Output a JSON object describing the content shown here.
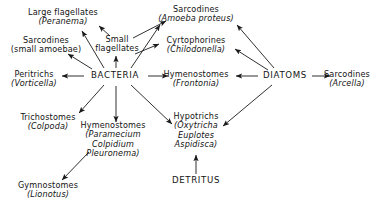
{
  "diagram": {
    "type": "food-web-diagram",
    "title": "",
    "background_color": "#ffffff",
    "text_color": "#131313",
    "nodes": [
      {
        "id": "large-flagellates",
        "lines": [
          "Large flagellates",
          "(Peranema)"
        ],
        "italic": [
          false,
          true
        ],
        "x": 63,
        "y": 17
      },
      {
        "id": "sarcodines-amoeba-proteus",
        "lines": [
          "Sarcodines",
          "(Amoeba proteus)"
        ],
        "italic": [
          false,
          true
        ],
        "x": 196,
        "y": 14
      },
      {
        "id": "small-flagellates",
        "lines": [
          "Small",
          "flagellates"
        ],
        "italic": [
          false,
          false
        ],
        "x": 117,
        "y": 44
      },
      {
        "id": "sarcodines-small-amoebae",
        "lines": [
          "Sarcodines",
          "(small amoebae)"
        ],
        "italic": [
          false,
          false
        ],
        "x": 46,
        "y": 45
      },
      {
        "id": "cyrtophorines",
        "lines": [
          "Cyrtophorines",
          "(Chilodonella)"
        ],
        "italic": [
          false,
          true
        ],
        "x": 196,
        "y": 45
      },
      {
        "id": "peritrichs",
        "lines": [
          "Peritrichs",
          "(Vorticella)"
        ],
        "italic": [
          false,
          true
        ],
        "x": 34,
        "y": 79
      },
      {
        "id": "bacteria",
        "lines": [
          "BACTERIA"
        ],
        "italic": [
          false
        ],
        "x": 115,
        "y": 76,
        "hub": true
      },
      {
        "id": "hymenostomes-frontonia",
        "lines": [
          "Hymenostomes",
          "(Frontonia)"
        ],
        "italic": [
          false,
          true
        ],
        "x": 196,
        "y": 79
      },
      {
        "id": "diatoms",
        "lines": [
          "DIATOMS"
        ],
        "italic": [
          false
        ],
        "x": 285,
        "y": 76,
        "hub": true
      },
      {
        "id": "sarcodines-arcella",
        "lines": [
          "Sarcodines",
          "(Arcella)"
        ],
        "italic": [
          false,
          true
        ],
        "x": 347,
        "y": 79
      },
      {
        "id": "trichostomes",
        "lines": [
          "Trichostomes",
          "(Colpoda)"
        ],
        "italic": [
          false,
          true
        ],
        "x": 48,
        "y": 122
      },
      {
        "id": "hypotrichs",
        "lines": [
          "Hypotrichs",
          "(Oxytricha",
          "Euplotes",
          "Aspidisca)"
        ],
        "italic": [
          false,
          true,
          true,
          true
        ],
        "x": 196,
        "y": 131
      },
      {
        "id": "hymenostomes-paramecium",
        "lines": [
          "Hymenostomes",
          "(Paramecium",
          "Colpidium",
          "Pleuronema)"
        ],
        "italic": [
          false,
          true,
          true,
          true
        ],
        "x": 113,
        "y": 140
      },
      {
        "id": "detritus",
        "lines": [
          "DETRITUS"
        ],
        "italic": [
          false
        ],
        "x": 196,
        "y": 181,
        "hub": true
      },
      {
        "id": "gymnostomes",
        "lines": [
          "Gymnostomes",
          "(Lionotus)"
        ],
        "italic": [
          false,
          true
        ],
        "x": 48,
        "y": 190
      }
    ],
    "edges": [
      {
        "id": "bacteria-to-large-flagellates",
        "from": "bacteria",
        "to": "large-flagellates",
        "arrow": "to"
      },
      {
        "id": "bacteria-to-sarcodines-small-amoebae",
        "from": "bacteria",
        "to": "sarcodines-small-amoebae",
        "arrow": "to"
      },
      {
        "id": "bacteria-to-small-flagellates",
        "from": "bacteria",
        "to": "small-flagellates",
        "arrow": "to"
      },
      {
        "id": "bacteria-to-peritrichs",
        "from": "bacteria",
        "to": "peritrichs",
        "arrow": "to"
      },
      {
        "id": "bacteria-to-hymenostomes-frontonia",
        "from": "bacteria",
        "to": "hymenostomes-frontonia",
        "arrow": "to"
      },
      {
        "id": "bacteria-to-sarcodines-amoeba-proteus",
        "from": "bacteria",
        "to": "sarcodines-amoeba-proteus",
        "arrow": "to"
      },
      {
        "id": "bacteria-to-trichostomes",
        "from": "bacteria",
        "to": "trichostomes",
        "arrow": "to"
      },
      {
        "id": "bacteria-to-hymenostomes-paramecium",
        "from": "bacteria",
        "to": "hymenostomes-paramecium",
        "arrow": "to"
      },
      {
        "id": "bacteria-to-hypotrichs",
        "from": "bacteria",
        "to": "hypotrichs",
        "arrow": "to"
      },
      {
        "id": "small-flagellates-to-large-flagellates",
        "from": "small-flagellates",
        "to": "large-flagellates",
        "arrow": "to"
      },
      {
        "id": "small-flagellates-to-sarcodines-amoeba-proteus",
        "from": "small-flagellates",
        "to": "sarcodines-amoeba-proteus",
        "arrow": "to"
      },
      {
        "id": "small-flagellates-to-cyrtophorines",
        "from": "small-flagellates",
        "to": "cyrtophorines",
        "arrow": "to"
      },
      {
        "id": "diatoms-to-sarcodines-amoeba-proteus",
        "from": "diatoms",
        "to": "sarcodines-amoeba-proteus",
        "arrow": "to"
      },
      {
        "id": "diatoms-to-cyrtophorines",
        "from": "diatoms",
        "to": "cyrtophorines",
        "arrow": "to"
      },
      {
        "id": "diatoms-to-hymenostomes-frontonia",
        "from": "diatoms",
        "to": "hymenostomes-frontonia",
        "arrow": "to"
      },
      {
        "id": "diatoms-to-sarcodines-arcella",
        "from": "diatoms",
        "to": "sarcodines-arcella",
        "arrow": "to"
      },
      {
        "id": "diatoms-to-hypotrichs",
        "from": "diatoms",
        "to": "hypotrichs",
        "arrow": "to"
      },
      {
        "id": "detritus-to-hypotrichs",
        "from": "detritus",
        "to": "hypotrichs",
        "arrow": "to"
      },
      {
        "id": "hymenostomes-paramecium-to-gymnostomes",
        "from": "hymenostomes-paramecium",
        "to": "gymnostomes",
        "arrow": "to"
      }
    ]
  }
}
